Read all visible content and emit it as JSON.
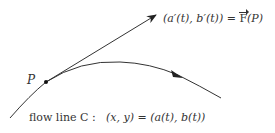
{
  "diagram": {
    "vector_label": {
      "lhs": "(a′(t), b′(t)) = ",
      "F": "F",
      "rhs": "(P)"
    },
    "point_label": "P",
    "flow_label": "flow line C :",
    "flow_equation": "(x, y) = (a(t), b(t))",
    "colors": {
      "stroke": "#333333",
      "background": "#ffffff"
    }
  }
}
